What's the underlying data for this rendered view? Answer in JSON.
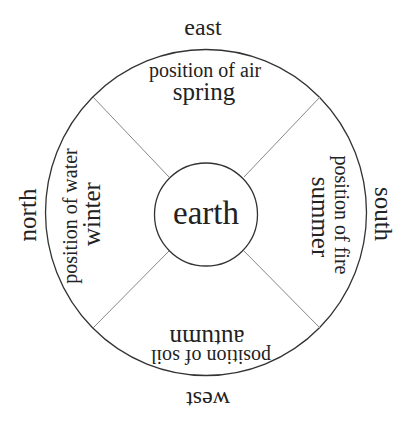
{
  "diagram": {
    "center": {
      "label": "earth"
    },
    "directions": {
      "top": "east",
      "left": "north",
      "right": "south",
      "bottom": "west"
    },
    "sectors": {
      "top": {
        "position": "position of air",
        "season": "spring"
      },
      "left": {
        "position": "position of water",
        "season": "winter"
      },
      "right": {
        "position": "position of fire",
        "season": "summer"
      },
      "bottom": {
        "position": "position of soil",
        "season": "autumn"
      }
    },
    "colors": {
      "outline": "#333333",
      "divider": "#888888",
      "text": "#222222",
      "background": "#ffffff"
    }
  }
}
